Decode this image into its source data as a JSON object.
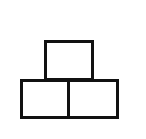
{
  "diagram": {
    "stroke_color": "#111111",
    "background": "#ffffff",
    "boxes": [
      {
        "id": "top",
        "x": 44,
        "y": 40,
        "w": 50,
        "h": 41
      },
      {
        "id": "bottom-left",
        "x": 20,
        "y": 79,
        "w": 50,
        "h": 40
      },
      {
        "id": "bottom-right",
        "x": 67,
        "y": 79,
        "w": 52,
        "h": 40
      }
    ]
  }
}
